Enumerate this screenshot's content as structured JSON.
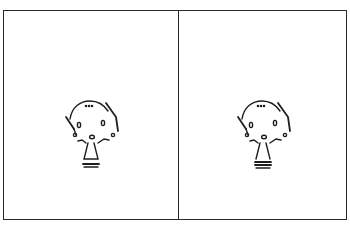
{
  "comic": {
    "panels": [
      {
        "id": "panel-1",
        "content": "character-standing",
        "caption": ""
      },
      {
        "id": "panel-2",
        "content": "character-standing",
        "caption": ""
      }
    ],
    "colors": {
      "ink": "#1e1e1e",
      "paper": "#ffffff",
      "border": "#2a2a2a"
    }
  }
}
